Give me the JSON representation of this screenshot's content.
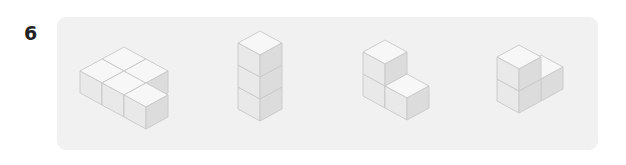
{
  "question": {
    "number": "6"
  },
  "panel": {
    "background": "#f1f1f1"
  },
  "colors": {
    "top_face": "#f7f7f7",
    "left_face": "#e9e9e9",
    "right_face": "#dcdcdc",
    "edge": "#c8c8c8"
  },
  "figures": [
    {
      "id": "figure-1",
      "description": "L-shaped arrangement of 4 cubes lying flat (3 in a row plus 1 behind)",
      "cube_count": 4
    },
    {
      "id": "figure-2",
      "description": "Vertical column of 3 stacked cubes",
      "cube_count": 3
    },
    {
      "id": "figure-3",
      "description": "Column of 2 cubes with 1 cube in front-right at base",
      "cube_count": 3
    },
    {
      "id": "figure-4",
      "description": "Column of 2 cubes with 1 cube behind-right at base",
      "cube_count": 3
    }
  ]
}
